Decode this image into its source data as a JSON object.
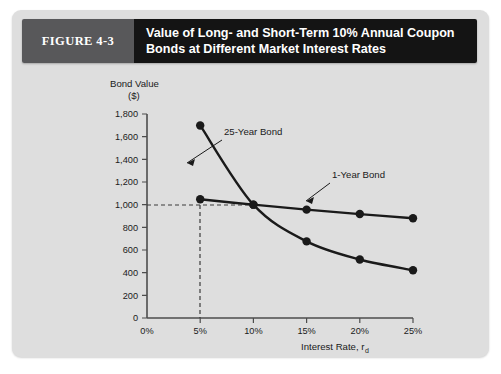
{
  "figure": {
    "number_label": "FIGURE 4-3",
    "title_line_1": "Value of Long- and Short-Term 10% Annual Coupon",
    "title_line_2": "Bonds at Different Market Interest Rates",
    "header_number_bg": "#58585a",
    "header_title_bg": "#141414",
    "panel_bg": "#dedede"
  },
  "chart_data": {
    "type": "line",
    "title": "Value of Long- and Short-Term 10% Annual Coupon Bonds at Different Market Interest Rates",
    "xlabel": "Interest Rate, r",
    "xlabel_subscript": "d",
    "ylabel_line_1": "Bond Value",
    "ylabel_line_2": "($)",
    "x": [
      5,
      10,
      15,
      20,
      25
    ],
    "x_unit": "%",
    "xlim": [
      0,
      25
    ],
    "ylim": [
      0,
      1800
    ],
    "xticks": [
      0,
      5,
      10,
      15,
      20,
      25
    ],
    "xtick_labels": [
      "0%",
      "5%",
      "10%",
      "15%",
      "20%",
      "25%"
    ],
    "yticks": [
      0,
      200,
      400,
      600,
      800,
      1000,
      1200,
      1400,
      1600,
      1800
    ],
    "ytick_labels": [
      "0",
      "200",
      "400",
      "600",
      "800",
      "1,000",
      "1,200",
      "1,400",
      "1,600",
      "1,800"
    ],
    "grid": false,
    "legend_position": "inline-annotations",
    "series": [
      {
        "name": "25-Year Bond",
        "values": [
          1699,
          1000,
          676,
          516,
          421
        ],
        "marker": "filled-circle",
        "color": "#1a1a1a"
      },
      {
        "name": "1-Year Bond",
        "values": [
          1048,
          1000,
          956,
          917,
          880
        ],
        "marker": "filled-circle",
        "color": "#1a1a1a"
      }
    ],
    "annotations": [
      {
        "label": "25-Year Bond",
        "points_to_series": "25-Year Bond"
      },
      {
        "label": "1-Year Bond",
        "points_to_series": "1-Year Bond"
      }
    ],
    "reference_lines": [
      {
        "name": "par-value-horizontal",
        "orientation": "horizontal",
        "value": 1000,
        "style": "dashed"
      },
      {
        "name": "coupon-rate-vertical",
        "orientation": "vertical",
        "value": 10,
        "style": "dashed"
      }
    ]
  }
}
